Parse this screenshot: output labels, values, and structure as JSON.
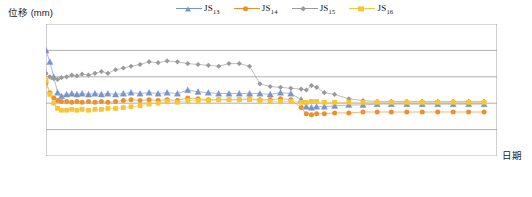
{
  "axis": {
    "y_title": "位移 (mm)",
    "x_title": "日期"
  },
  "legend": [
    {
      "name": "JS13",
      "base": "JS",
      "sub": "13",
      "color": "#7a94c9",
      "marker": "triangle"
    },
    {
      "name": "JS14",
      "base": "JS",
      "sub": "14",
      "color": "#e8922f",
      "marker": "circle"
    },
    {
      "name": "JS15",
      "base": "JS",
      "sub": "15",
      "color": "#9a9a9a",
      "marker": "diamond"
    },
    {
      "name": "JS16",
      "base": "JS",
      "sub": "16",
      "color": "#f5c63c",
      "marker": "square"
    }
  ],
  "chart_data": {
    "type": "line",
    "title": "",
    "xlabel": "日期",
    "ylabel": "位移 (mm)",
    "ylim": [
      -0.5,
      1.0
    ],
    "yticks": [
      1.0,
      0.7,
      0.4,
      0.1,
      -0.2,
      -0.5
    ],
    "ytick_labels": [
      "1.0",
      "0.7",
      "0.4",
      "0.1",
      "-0.2",
      "-0.5"
    ],
    "xticks": [
      "2017/7/3",
      "2017/10/11",
      "2018/1/19",
      "2018/4/29",
      "2018/8/7",
      "2018/11/15",
      "2019/2/23",
      "2019/6/3"
    ],
    "xlim": [
      0,
      700
    ],
    "grid": true,
    "legend_position": "top",
    "series": [
      {
        "name": "JS13",
        "color": "#7a94c9",
        "marker": "triangle",
        "x": [
          0,
          6,
          12,
          18,
          24,
          32,
          40,
          48,
          56,
          66,
          76,
          86,
          96,
          108,
          120,
          132,
          146,
          160,
          174,
          188,
          204,
          220,
          236,
          252,
          268,
          284,
          300,
          316,
          332,
          348,
          364,
          380,
          396,
          404,
          412,
          420,
          432,
          448,
          470,
          492,
          514,
          536,
          560,
          584,
          608,
          632,
          656,
          680
        ],
        "y": [
          0.7,
          0.57,
          0.4,
          0.22,
          0.18,
          0.2,
          0.21,
          0.2,
          0.21,
          0.2,
          0.21,
          0.2,
          0.21,
          0.2,
          0.21,
          0.22,
          0.21,
          0.22,
          0.21,
          0.22,
          0.21,
          0.25,
          0.23,
          0.22,
          0.21,
          0.21,
          0.21,
          0.21,
          0.21,
          0.2,
          0.22,
          0.21,
          0.14,
          0.06,
          0.05,
          0.06,
          0.06,
          0.07,
          0.08,
          0.08,
          0.09,
          0.09,
          0.09,
          0.09,
          0.09,
          0.09,
          0.09,
          0.09
        ]
      },
      {
        "name": "JS14",
        "color": "#e8922f",
        "marker": "circle",
        "x": [
          0,
          6,
          12,
          18,
          24,
          32,
          40,
          48,
          56,
          66,
          76,
          86,
          96,
          108,
          120,
          132,
          146,
          160,
          174,
          188,
          204,
          220,
          236,
          252,
          268,
          284,
          300,
          316,
          332,
          348,
          364,
          380,
          396,
          404,
          412,
          420,
          432,
          448,
          470,
          492,
          514,
          536,
          560,
          584,
          608,
          632,
          656,
          680
        ],
        "y": [
          0.33,
          0.22,
          0.16,
          0.13,
          0.12,
          0.12,
          0.11,
          0.12,
          0.11,
          0.12,
          0.11,
          0.12,
          0.11,
          0.12,
          0.13,
          0.14,
          0.13,
          0.14,
          0.13,
          0.14,
          0.13,
          0.16,
          0.15,
          0.14,
          0.14,
          0.14,
          0.14,
          0.15,
          0.14,
          0.14,
          0.15,
          0.14,
          0.05,
          -0.02,
          -0.03,
          -0.02,
          -0.02,
          -0.01,
          -0.01,
          0.0,
          0.0,
          0.0,
          0.0,
          0.0,
          0.0,
          0.0,
          0.0,
          0.0
        ]
      },
      {
        "name": "JS15",
        "color": "#9a9a9a",
        "marker": "diamond",
        "x": [
          0,
          6,
          12,
          18,
          24,
          32,
          40,
          48,
          56,
          66,
          76,
          86,
          96,
          108,
          120,
          132,
          146,
          160,
          174,
          188,
          204,
          220,
          236,
          252,
          268,
          284,
          300,
          316,
          332,
          348,
          364,
          380,
          396,
          404,
          412,
          420,
          432,
          448,
          470,
          492,
          514,
          536,
          560,
          584,
          608,
          632,
          656,
          680
        ],
        "y": [
          0.44,
          0.4,
          0.38,
          0.37,
          0.39,
          0.4,
          0.42,
          0.41,
          0.43,
          0.42,
          0.44,
          0.46,
          0.44,
          0.48,
          0.5,
          0.52,
          0.54,
          0.57,
          0.56,
          0.58,
          0.57,
          0.55,
          0.54,
          0.53,
          0.52,
          0.55,
          0.55,
          0.52,
          0.32,
          0.29,
          0.28,
          0.27,
          0.26,
          0.25,
          0.3,
          0.28,
          0.22,
          0.2,
          0.15,
          0.13,
          0.12,
          0.12,
          0.12,
          0.12,
          0.12,
          0.12,
          0.12,
          0.12
        ]
      },
      {
        "name": "JS16",
        "color": "#f5c63c",
        "marker": "square",
        "x": [
          0,
          6,
          12,
          18,
          24,
          32,
          40,
          48,
          56,
          66,
          76,
          86,
          96,
          108,
          120,
          132,
          146,
          160,
          174,
          188,
          204,
          220,
          236,
          252,
          268,
          284,
          300,
          316,
          332,
          348,
          364,
          380,
          396,
          404,
          412,
          420,
          432,
          448,
          470,
          492,
          514,
          536,
          560,
          584,
          608,
          632,
          656,
          680
        ],
        "y": [
          0.36,
          0.2,
          0.1,
          0.04,
          0.02,
          0.02,
          0.03,
          0.02,
          0.03,
          0.02,
          0.03,
          0.03,
          0.04,
          0.04,
          0.05,
          0.06,
          0.07,
          0.09,
          0.1,
          0.12,
          0.11,
          0.13,
          0.13,
          0.13,
          0.14,
          0.14,
          0.14,
          0.14,
          0.13,
          0.12,
          0.12,
          0.12,
          0.11,
          0.11,
          0.12,
          0.12,
          0.11,
          0.11,
          0.11,
          0.11,
          0.11,
          0.11,
          0.11,
          0.11,
          0.11,
          0.11,
          0.11,
          0.11
        ]
      }
    ]
  }
}
